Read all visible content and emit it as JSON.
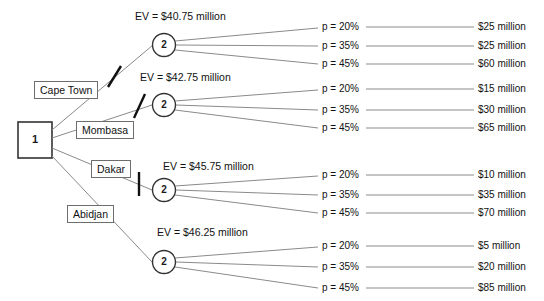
{
  "diagram": {
    "type": "decision-tree",
    "title_present": false,
    "colors": {
      "line": "#808080",
      "node_stroke": "#333333",
      "box_stroke": "#6d6d6d",
      "text": "#111111",
      "background": "#ffffff",
      "pruned_mark": "#000000"
    },
    "decision_node": {
      "label": "1",
      "shape": "square"
    },
    "alternatives": [
      {
        "label": "Cape Town",
        "pruned": true,
        "chance_node": {
          "label": "2",
          "ev_label": "EV = $40.75 million",
          "ev_value": 40.75,
          "outcomes": [
            {
              "probability_label": "p = 20%",
              "probability": 0.2,
              "payoff_label": "$25 million",
              "payoff": 25
            },
            {
              "probability_label": "p = 35%",
              "probability": 0.35,
              "payoff_label": "$25 million",
              "payoff": 25
            },
            {
              "probability_label": "p = 45%",
              "probability": 0.45,
              "payoff_label": "$60 million",
              "payoff": 60
            }
          ]
        }
      },
      {
        "label": "Mombasa",
        "pruned": true,
        "chance_node": {
          "label": "2",
          "ev_label": "EV = $42.75 million",
          "ev_value": 42.75,
          "outcomes": [
            {
              "probability_label": "p = 20%",
              "probability": 0.2,
              "payoff_label": "$15 million",
              "payoff": 15
            },
            {
              "probability_label": "p = 35%",
              "probability": 0.35,
              "payoff_label": "$30 million",
              "payoff": 30
            },
            {
              "probability_label": "p = 45%",
              "probability": 0.45,
              "payoff_label": "$65 million",
              "payoff": 65
            }
          ]
        }
      },
      {
        "label": "Dakar",
        "pruned": true,
        "chance_node": {
          "label": "2",
          "ev_label": "EV = $45.75 million",
          "ev_value": 45.75,
          "outcomes": [
            {
              "probability_label": "p = 20%",
              "probability": 0.2,
              "payoff_label": "$10 million",
              "payoff": 10
            },
            {
              "probability_label": "p = 35%",
              "probability": 0.35,
              "payoff_label": "$35 million",
              "payoff": 35
            },
            {
              "probability_label": "p = 45%",
              "probability": 0.45,
              "payoff_label": "$70 million",
              "payoff": 70
            }
          ]
        }
      },
      {
        "label": "Abidjan",
        "pruned": false,
        "chance_node": {
          "label": "2",
          "ev_label": "EV = $46.25 million",
          "ev_value": 46.25,
          "outcomes": [
            {
              "probability_label": "p = 20%",
              "probability": 0.2,
              "payoff_label": "$5 million",
              "payoff": 5
            },
            {
              "probability_label": "p = 35%",
              "probability": 0.35,
              "payoff_label": "$20 million",
              "payoff": 20
            },
            {
              "probability_label": "p = 45%",
              "probability": 0.45,
              "payoff_label": "$85 million",
              "payoff": 85
            }
          ]
        }
      }
    ]
  }
}
